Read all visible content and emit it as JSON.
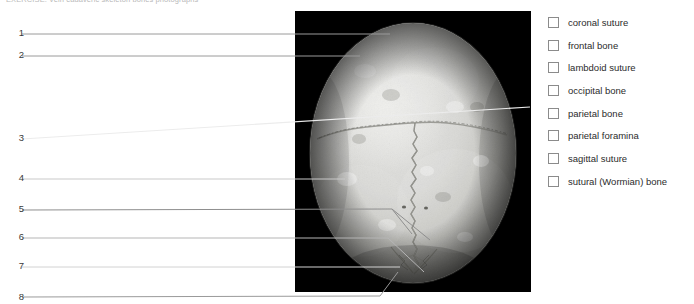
{
  "caption": {
    "text": "EXERCISE: Vein cadaveric skeleton bones photographs"
  },
  "photo": {
    "alt_name": "skull-superior-view-photograph",
    "background_color": "#000000",
    "description": "Grayscale photograph of a human skull, superior (vertex) view, showing the sagittal, coronal and lambdoid sutures"
  },
  "left_labels": [
    {
      "number": "1",
      "y": 33
    },
    {
      "number": "2",
      "y": 55
    },
    {
      "number": "3",
      "y": 138
    },
    {
      "number": "4",
      "y": 178
    },
    {
      "number": "5",
      "y": 209
    },
    {
      "number": "6",
      "y": 238
    },
    {
      "number": "7",
      "y": 266
    },
    {
      "number": "8",
      "y": 298
    }
  ],
  "terms": [
    {
      "label": "coronal suture",
      "checked": false
    },
    {
      "label": "frontal bone",
      "checked": false
    },
    {
      "label": "lambdoid suture",
      "checked": false
    },
    {
      "label": "occipital bone",
      "checked": false
    },
    {
      "label": "parietal bone",
      "checked": false
    },
    {
      "label": "parietal foramina",
      "checked": false
    },
    {
      "label": "sagittal suture",
      "checked": false
    },
    {
      "label": "sutural (Wormian) bone",
      "checked": false
    }
  ],
  "colors": {
    "page_background": "#ffffff",
    "photo_background": "#000000",
    "leader_line_dark": "#9a9a9a",
    "leader_line_light": "#e8e8e8",
    "checkbox_border": "#8b8b8b",
    "text": "#2b2b2b",
    "caption_text": "#b9b9b9"
  }
}
